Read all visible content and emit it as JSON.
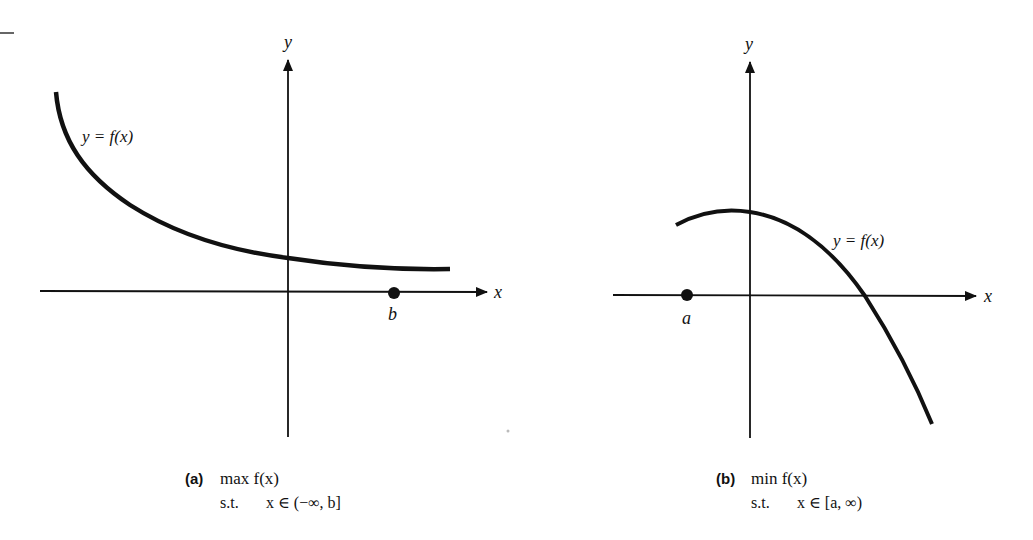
{
  "figure": {
    "panels": [
      {
        "id": "a",
        "y_axis_label": "y",
        "x_axis_label": "x",
        "curve_label": "y = f(x)",
        "point_label": "b",
        "caption_tag": "(a)",
        "caption_line1": "max f(x)",
        "caption_line2_prefix": "s.t.",
        "caption_line2": "x ∈ (−∞, b]"
      },
      {
        "id": "b",
        "y_axis_label": "y",
        "x_axis_label": "x",
        "curve_label": "y = f(x)",
        "point_label": "a",
        "caption_tag": "(b)",
        "caption_line1": "min f(x)",
        "caption_line2_prefix": "s.t.",
        "caption_line2": "x ∈ [a, ∞)"
      }
    ],
    "colors": {
      "ink": "#111111",
      "background": "#ffffff"
    }
  }
}
